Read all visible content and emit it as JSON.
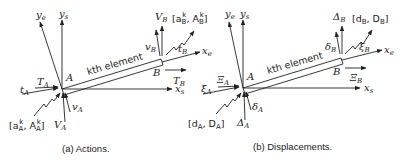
{
  "panels": [
    {
      "id": "a",
      "caption": "(a) Actions.",
      "element_label": "kth element",
      "node_A": "A",
      "node_B": "B",
      "axes": {
        "ye": "y",
        "ye_sub": "e",
        "ys": "y",
        "ys_sub": "s",
        "xs": "x",
        "xs_sub": "s",
        "xe": "x",
        "xe_sub": "e"
      },
      "at_A": {
        "axial_e": "t",
        "axial_e_sub": "A",
        "axial_s": "T",
        "axial_s_sub": "A",
        "trans_e": "v",
        "trans_e_sub": "A",
        "trans_s": "V",
        "trans_s_sub": "A",
        "vector": "[a",
        "vector_sub": "A",
        "vector_sup": "k",
        "vector_mid": ", A",
        "vector_sub2": "A",
        "vector_sup2": "k",
        "vector_end": "]"
      },
      "at_B": {
        "axial_e": "t",
        "axial_e_sub": "B",
        "axial_s": "T",
        "axial_s_sub": "B",
        "trans_e": "v",
        "trans_e_sub": "B",
        "trans_s": "V",
        "trans_s_sub": "B",
        "vector": "[a",
        "vector_sub": "B",
        "vector_sup": "k",
        "vector_mid": ", A",
        "vector_sub2": "B",
        "vector_sup2": "k",
        "vector_end": "]"
      }
    },
    {
      "id": "b",
      "caption": "(b) Displacements.",
      "element_label": "kth element",
      "node_A": "A",
      "node_B": "B",
      "axes": {
        "ye": "y",
        "ye_sub": "e",
        "ys": "y",
        "ys_sub": "s",
        "xs": "x",
        "xs_sub": "s",
        "xe": "x",
        "xe_sub": "e"
      },
      "at_A": {
        "axial_e": "ξ",
        "axial_e_sub": "A",
        "axial_s": "Ξ",
        "axial_s_sub": "A",
        "trans_e": "δ",
        "trans_e_sub": "A",
        "trans_s": "Δ",
        "trans_s_sub": "A",
        "vector": "[d",
        "vector_sub": "A",
        "vector_mid": ", D",
        "vector_sub2": "A",
        "vector_end": "]"
      },
      "at_B": {
        "axial_e": "ξ",
        "axial_e_sub": "B",
        "axial_s": "Ξ",
        "axial_s_sub": "B",
        "trans_e": "δ",
        "trans_e_sub": "B",
        "trans_s": "Δ",
        "trans_s_sub": "B",
        "vector": "[d",
        "vector_sub": "B",
        "vector_mid": ", D",
        "vector_sub2": "B",
        "vector_end": "]"
      }
    }
  ]
}
